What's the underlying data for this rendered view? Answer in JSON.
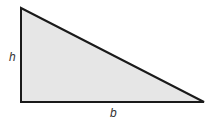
{
  "diagram": {
    "shape": "right-triangle",
    "fill_color": "#e6e6e6",
    "stroke_color": "#1a1a1a",
    "vertices": [
      [
        21,
        8
      ],
      [
        21,
        102
      ],
      [
        204,
        102
      ]
    ],
    "labels": {
      "height": "h",
      "base": "b"
    }
  }
}
